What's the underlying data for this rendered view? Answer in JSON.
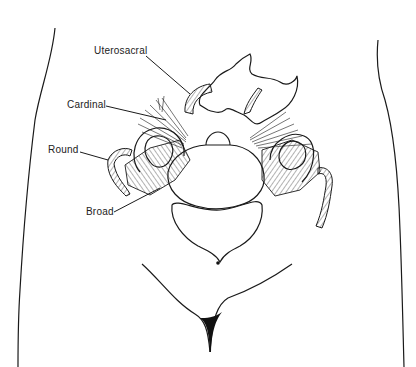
{
  "figure": {
    "labels": [
      {
        "id": "uterosacral",
        "text": "Uterosacral",
        "x": 94,
        "y": 49
      },
      {
        "id": "cardinal",
        "text": "Cardinal",
        "x": 67,
        "y": 101
      },
      {
        "id": "round",
        "text": "Round",
        "x": 48,
        "y": 145
      },
      {
        "id": "broad",
        "text": "Broad",
        "x": 86,
        "y": 207
      }
    ],
    "colors": {
      "ink": "#1a1a1a",
      "background": "#ffffff"
    }
  }
}
